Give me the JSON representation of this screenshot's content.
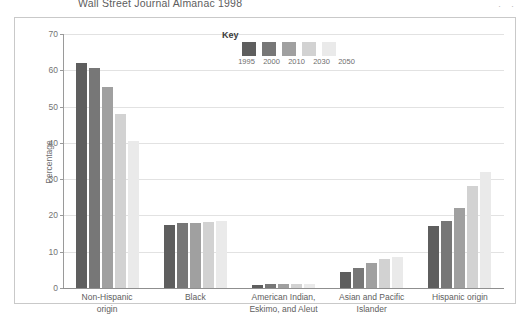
{
  "page": {
    "title": "Wall Street Journal Almanac 1998",
    "corner_marks": "··"
  },
  "chart_data": {
    "type": "bar",
    "title": "",
    "xlabel": "",
    "ylabel": "Percentage",
    "ylim": [
      0,
      70
    ],
    "yticks": [
      0,
      10,
      20,
      30,
      40,
      50,
      60,
      70
    ],
    "grid": true,
    "legend_title": "Key",
    "legend_position": "top-center",
    "categories": [
      "Non-Hispanic origin",
      "Black",
      "American Indian, Eskimo, and Aleut",
      "Asian and Pacific Islander",
      "Hispanic origin"
    ],
    "category_labels": [
      [
        "Non-Hispanic",
        "origin"
      ],
      [
        "Black"
      ],
      [
        "American Indian,",
        "Eskimo, and Aleut"
      ],
      [
        "Asian and Pacific",
        "Islander"
      ],
      [
        "Hispanic origin"
      ]
    ],
    "series": [
      {
        "name": "1995",
        "color": "#5e5e5e",
        "values": [
          62.0,
          17.5,
          0.9,
          4.5,
          17.0
        ]
      },
      {
        "name": "2000",
        "color": "#777777",
        "values": [
          60.5,
          17.8,
          1.0,
          5.5,
          18.5
        ]
      },
      {
        "name": "2010",
        "color": "#a0a0a0",
        "values": [
          55.5,
          18.0,
          1.0,
          7.0,
          22.0
        ]
      },
      {
        "name": "2030",
        "color": "#d2d2d2",
        "values": [
          48.0,
          18.2,
          1.1,
          8.0,
          28.0
        ]
      },
      {
        "name": "2050",
        "color": "#eaeaea",
        "values": [
          40.5,
          18.5,
          1.2,
          8.5,
          32.0
        ]
      }
    ]
  }
}
